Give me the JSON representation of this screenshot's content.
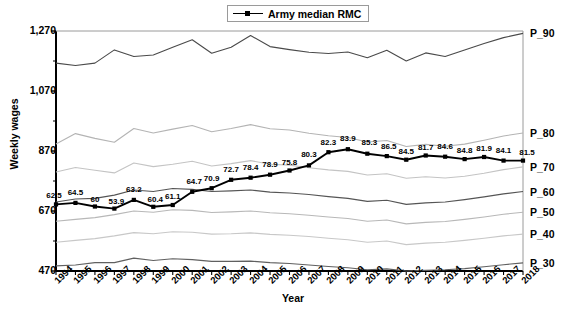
{
  "chart_data": {
    "type": "line",
    "title": "",
    "xlabel": "Year",
    "ylabel": "Weekly wages",
    "ylim": [
      470,
      1270
    ],
    "yticks": [
      "470",
      "670",
      "870",
      "1,070",
      "1,270"
    ],
    "grid": false,
    "legend": {
      "position": "top-center",
      "entries": [
        "Army median RMC"
      ]
    },
    "categories": [
      "1994",
      "1995",
      "1996",
      "1997",
      "1998",
      "1999",
      "2000",
      "2001",
      "2002",
      "2003",
      "2004",
      "2005",
      "2006",
      "2007",
      "2008",
      "2009",
      "2010",
      "2011",
      "2012",
      "2013",
      "2014",
      "2015",
      "2016",
      "2017",
      "2018"
    ],
    "right_axis_labels": [
      "P_90",
      "P_80",
      "P_70",
      "P_60",
      "P_50",
      "P_40",
      "P_30"
    ],
    "series": [
      {
        "name": "Army median RMC",
        "style": "black-marker-line",
        "color": "#000000",
        "values": [
          692,
          697,
          685,
          678,
          707,
          684,
          690,
          734,
          746,
          774,
          781,
          791,
          805,
          822,
          866,
          876,
          861,
          853,
          841,
          855,
          851,
          843,
          850,
          838,
          838
        ],
        "data_labels": [
          "62.5",
          "64.5",
          "60",
          "53.9",
          "63.2",
          "60.4",
          "61.1",
          "64.7",
          "70.9",
          "72.7",
          "78.4",
          "78.9",
          "75.8",
          "80.3",
          "82.3",
          "83.9",
          "85.3",
          "86.5",
          "84.5",
          "81.7",
          "84.6",
          "84.8",
          "81.9",
          "84.1",
          "81.5"
        ],
        "label_meaning": "percentile rank of Army median RMC within civilian weekly wage distribution"
      },
      {
        "name": "P_90",
        "style": "dark-gray-line",
        "color": "#4a4a4a",
        "values": [
          1163,
          1155,
          1163,
          1207,
          1185,
          1190,
          1216,
          1241,
          1196,
          1216,
          1255,
          1218,
          1208,
          1199,
          1195,
          1200,
          1181,
          1206,
          1170,
          1197,
          1185,
          1207,
          1228,
          1248,
          1262
        ]
      },
      {
        "name": "P_80",
        "style": "light-gray-line",
        "color": "#b4b4b4",
        "values": [
          893,
          928,
          912,
          899,
          945,
          930,
          943,
          955,
          934,
          945,
          958,
          944,
          940,
          929,
          921,
          915,
          900,
          905,
          885,
          892,
          886,
          893,
          906,
          920,
          930
        ]
      },
      {
        "name": "P_70",
        "style": "light-gray-line",
        "color": "#c4c4c4",
        "values": [
          800,
          815,
          806,
          797,
          830,
          818,
          826,
          836,
          820,
          828,
          838,
          826,
          823,
          814,
          807,
          802,
          790,
          794,
          779,
          784,
          780,
          786,
          796,
          808,
          817
        ]
      },
      {
        "name": "P_60",
        "style": "dark-gray-line",
        "color": "#555555",
        "values": [
          700,
          710,
          712,
          723,
          740,
          735,
          745,
          742,
          735,
          737,
          740,
          733,
          730,
          725,
          718,
          712,
          702,
          706,
          692,
          697,
          700,
          708,
          717,
          727,
          735
        ]
      },
      {
        "name": "P_50",
        "style": "light-gray-line",
        "color": "#b8b8b8",
        "values": [
          636,
          642,
          648,
          658,
          670,
          666,
          674,
          672,
          665,
          667,
          670,
          664,
          661,
          656,
          650,
          645,
          636,
          640,
          627,
          632,
          635,
          642,
          650,
          659,
          666
        ]
      },
      {
        "name": "P_40",
        "style": "light-gray-line",
        "color": "#c8c8c8",
        "values": [
          566,
          572,
          578,
          587,
          598,
          594,
          601,
          599,
          593,
          594,
          597,
          592,
          589,
          585,
          579,
          574,
          566,
          570,
          558,
          563,
          566,
          572,
          579,
          587,
          593
        ]
      },
      {
        "name": "P_30",
        "style": "dark-gray-line",
        "color": "#606060",
        "values": [
          487,
          490,
          498,
          498,
          513,
          505,
          511,
          508,
          502,
          502,
          503,
          498,
          495,
          490,
          485,
          481,
          474,
          477,
          470,
          472,
          474,
          478,
          484,
          491,
          497
        ]
      }
    ]
  }
}
